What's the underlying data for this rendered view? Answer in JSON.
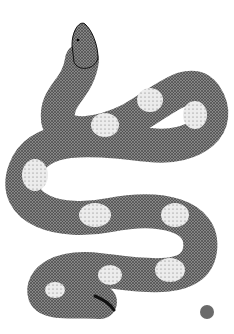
{
  "image": {
    "subject": "Stippled ink illustration of a coiled snake with blotched pattern",
    "background": "#ffffff",
    "ink_color": "#1a1a1a",
    "light_blotch_color": "#e6e6e6"
  },
  "marker": {
    "shape": "circle",
    "color": "#6a6a6a"
  }
}
